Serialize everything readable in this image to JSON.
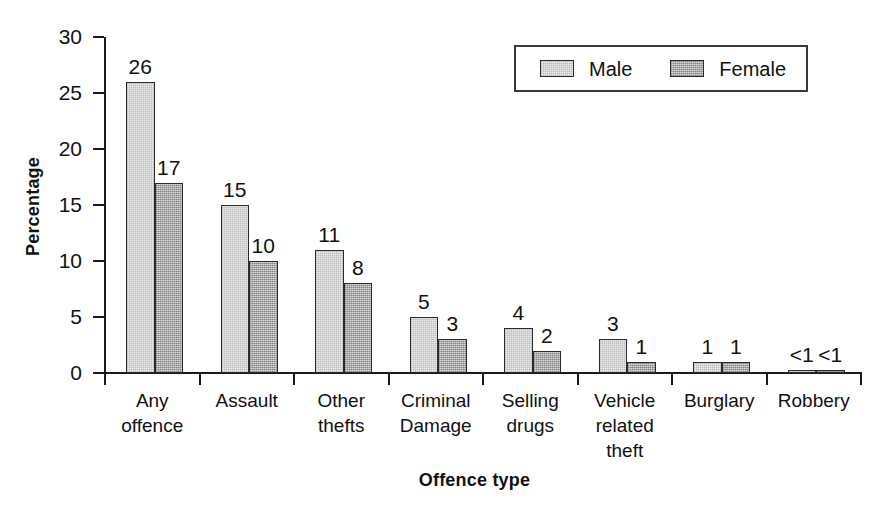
{
  "chart_data": {
    "type": "bar",
    "title": "",
    "xlabel": "Offence type",
    "ylabel": "Percentage",
    "ylim": [
      0,
      30
    ],
    "yticks": [
      0,
      5,
      10,
      15,
      20,
      25,
      30
    ],
    "ytick_labels": [
      "0",
      "5",
      "10",
      "15",
      "20",
      "25",
      "30"
    ],
    "grid": false,
    "legend_position": "top-right",
    "categories": [
      "Any\noffence",
      "Assault",
      "Other\nthefts",
      "Criminal\nDamage",
      "Selling\ndrugs",
      "Vehicle\nrelated\ntheft",
      "Burglary",
      "Robbery"
    ],
    "series": [
      {
        "name": "Male",
        "color": "#ececec",
        "values": [
          26,
          15,
          11,
          5,
          4,
          3,
          1,
          0.3
        ],
        "labels": [
          "26",
          "15",
          "11",
          "5",
          "4",
          "3",
          "1",
          "<1"
        ]
      },
      {
        "name": "Female",
        "color": "#bcbcbc",
        "values": [
          17,
          10,
          8,
          3,
          2,
          1,
          1,
          0.3
        ],
        "labels": [
          "17",
          "10",
          "8",
          "3",
          "2",
          "1",
          "1",
          "<1"
        ]
      }
    ]
  },
  "legend": {
    "entries": [
      {
        "label": "Male"
      },
      {
        "label": "Female"
      }
    ]
  },
  "axes": {
    "y_title": "Percentage",
    "x_title": "Offence type"
  }
}
